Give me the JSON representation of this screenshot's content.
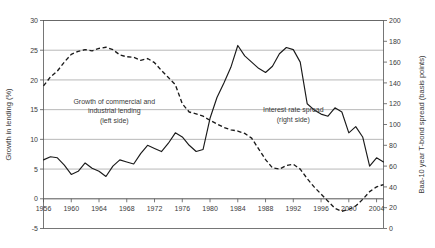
{
  "chart_data": {
    "type": "line",
    "title": "",
    "xlabel": "",
    "ylabel": "Growth in lending (%)",
    "y2label": "Baa-10 year T-bond spread (basis points)",
    "xlim": [
      1956,
      2005
    ],
    "ylim": [
      -5,
      30
    ],
    "y2lim": [
      0,
      200
    ],
    "yticks": [
      -5,
      0,
      5,
      10,
      15,
      20,
      25,
      30
    ],
    "y2ticks": [
      0,
      20,
      40,
      60,
      80,
      100,
      120,
      140,
      160,
      180,
      200
    ],
    "xticks": [
      1956,
      1960,
      1964,
      1968,
      1972,
      1976,
      1980,
      1984,
      1988,
      1992,
      1996,
      2000,
      2004
    ],
    "grid": true,
    "legend_position": "inline-annotations",
    "annotations": [
      {
        "name": "lending-annotation",
        "lines": [
          "Growth of commercial and",
          "industrial lending",
          "(left side)"
        ],
        "x": 1966.2,
        "y": 16.0
      },
      {
        "name": "spread-annotation",
        "lines": [
          "Interest rate spread",
          "(right side)"
        ],
        "x": 1992.0,
        "y": 14.6
      }
    ],
    "series": [
      {
        "name": "Growth of commercial and industrial lending (left side)",
        "axis": "left",
        "style": "dashed",
        "color": "#1a1a1a",
        "x": [
          1956,
          1957,
          1958,
          1959,
          1960,
          1961,
          1962,
          1963,
          1964,
          1965,
          1966,
          1967,
          1968,
          1969,
          1970,
          1971,
          1972,
          1973,
          1974,
          1975,
          1976,
          1977,
          1978,
          1979,
          1980,
          1981,
          1982,
          1983,
          1984,
          1985,
          1986,
          1987,
          1988,
          1989,
          1990,
          1991,
          1992,
          1993,
          1994,
          1995,
          1996,
          1997,
          1998,
          1999,
          2000,
          2001,
          2002,
          2003,
          2004,
          2005
        ],
        "y": [
          19.0,
          20.5,
          21.5,
          23.0,
          24.3,
          24.8,
          25.1,
          24.9,
          25.3,
          25.5,
          25.1,
          24.2,
          23.9,
          23.8,
          23.3,
          23.6,
          22.9,
          21.6,
          20.4,
          19.2,
          16.0,
          14.6,
          14.3,
          13.9,
          13.2,
          12.6,
          12.0,
          11.6,
          11.4,
          11.0,
          10.2,
          8.4,
          6.6,
          5.2,
          5.0,
          5.6,
          5.8,
          5.0,
          3.4,
          2.0,
          0.8,
          -0.4,
          -1.6,
          -2.1,
          -1.8,
          -1.2,
          -0.1,
          1.2,
          2.0,
          2.4
        ]
      },
      {
        "name": "Interest rate spread (right side)",
        "axis": "right",
        "style": "solid",
        "color": "#1a1a1a",
        "x": [
          1956,
          1957,
          1958,
          1959,
          1960,
          1961,
          1962,
          1963,
          1964,
          1965,
          1966,
          1967,
          1968,
          1969,
          1970,
          1971,
          1972,
          1973,
          1974,
          1975,
          1976,
          1977,
          1978,
          1979,
          1980,
          1981,
          1982,
          1983,
          1984,
          1985,
          1986,
          1987,
          1988,
          1989,
          1990,
          1991,
          1992,
          1993,
          1994,
          1995,
          1996,
          1997,
          1998,
          1999,
          2000,
          2001,
          2002,
          2003,
          2004,
          2005
        ],
        "y": [
          66,
          69,
          68,
          61,
          52,
          55,
          63,
          58,
          55,
          50,
          60,
          66,
          64,
          62,
          72,
          80,
          77,
          74,
          82,
          92,
          88,
          80,
          74,
          76,
          106,
          126,
          140,
          155,
          176,
          166,
          160,
          154,
          150,
          156,
          168,
          174,
          172,
          160,
          120,
          114,
          110,
          108,
          116,
          112,
          92,
          98,
          88,
          60,
          68,
          64
        ]
      }
    ]
  },
  "axes": {
    "left_title": "Growth in lending (%)",
    "right_title": "Baa-10 year T-bond spread (basis points)",
    "left_ticks": [
      "30",
      "25",
      "20",
      "15",
      "10",
      "5",
      "0",
      "-5"
    ],
    "right_ticks": [
      "200",
      "180",
      "160",
      "140",
      "120",
      "100",
      "80",
      "60",
      "40",
      "20",
      "0"
    ],
    "bottom_ticks": [
      "1956",
      "1960",
      "1964",
      "1968",
      "1972",
      "1976",
      "1980",
      "1984",
      "1988",
      "1992",
      "1996",
      "2000",
      "2004"
    ]
  }
}
